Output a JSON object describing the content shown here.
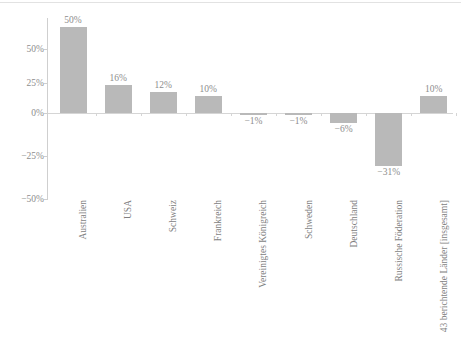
{
  "chart_data": {
    "type": "bar",
    "title": "",
    "subtitle": "",
    "xlabel": "",
    "ylabel": "",
    "categories": [
      "Australien",
      "USA",
      "Schweiz",
      "Frankreich",
      "Vereinigtes Königreich",
      "Schweden",
      "Deutschland",
      "Russische Föderation",
      "43 berichtende Länder [insgesamt]"
    ],
    "values": [
      50,
      16,
      12,
      10,
      -1,
      -1,
      -6,
      -31,
      10
    ],
    "value_labels": [
      "50%",
      "16%",
      "12%",
      "10%",
      "−1%",
      "−1%",
      "−6%",
      "−31%",
      "10%"
    ],
    "ylim": [
      -60,
      60
    ],
    "yticks": [
      50,
      25,
      0,
      -25,
      -50
    ],
    "ytick_labels": [
      "50%",
      "25%",
      "0%",
      "−25%",
      "−50%"
    ],
    "grid": false,
    "legend": null,
    "bar_color": "#b9b9b9",
    "axis_color": "#cfcfcf",
    "text_color": "#8d8d8d"
  }
}
